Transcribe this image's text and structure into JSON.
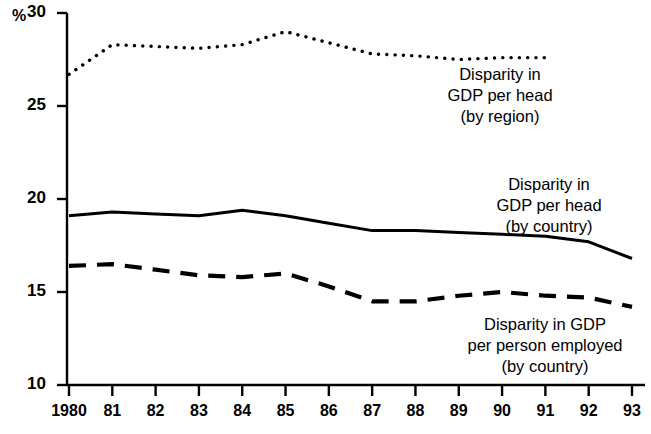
{
  "chart_data": {
    "type": "line",
    "title": "",
    "subtitle": "",
    "xlabel": "",
    "ylabel": "%",
    "y_unit_label": "%",
    "x": [
      1980,
      1981,
      1982,
      1983,
      1984,
      1985,
      1986,
      1987,
      1988,
      1989,
      1990,
      1991,
      1992,
      1993
    ],
    "xtick_labels": [
      "1980",
      "81",
      "82",
      "83",
      "84",
      "85",
      "86",
      "87",
      "88",
      "89",
      "90",
      "91",
      "92",
      "93"
    ],
    "ytick_labels": [
      "30",
      "25",
      "20",
      "15",
      "10"
    ],
    "yticks": [
      30,
      25,
      20,
      15,
      10
    ],
    "ylim": [
      10,
      30
    ],
    "xlim": [
      1980,
      1993
    ],
    "grid": false,
    "legend_position": "inline-annotations",
    "series": [
      {
        "name": "Disparity in GDP per head (by region)",
        "style": "dotted",
        "color": "#000000",
        "x": [
          1980,
          1981,
          1982,
          1983,
          1984,
          1985,
          1986,
          1987,
          1988,
          1989,
          1990,
          1991
        ],
        "values": [
          26.7,
          28.3,
          28.2,
          28.1,
          28.3,
          29.0,
          28.4,
          27.8,
          27.7,
          27.5,
          27.6,
          27.6
        ]
      },
      {
        "name": "Disparity in GDP per head (by country)",
        "style": "solid",
        "color": "#000000",
        "x": [
          1980,
          1981,
          1982,
          1983,
          1984,
          1985,
          1986,
          1987,
          1988,
          1989,
          1990,
          1991,
          1992,
          1993
        ],
        "values": [
          19.1,
          19.3,
          19.2,
          19.1,
          19.4,
          19.1,
          18.7,
          18.3,
          18.3,
          18.2,
          18.1,
          18.0,
          17.7,
          16.8
        ]
      },
      {
        "name": "Disparity in GDP per person employed (by country)",
        "style": "dashed",
        "color": "#000000",
        "x": [
          1980,
          1981,
          1982,
          1983,
          1984,
          1985,
          1986,
          1987,
          1988,
          1989,
          1990,
          1991,
          1992,
          1993
        ],
        "values": [
          16.4,
          16.5,
          16.2,
          15.9,
          15.8,
          16.0,
          15.3,
          14.5,
          14.5,
          14.8,
          15.0,
          14.8,
          14.7,
          14.2
        ]
      }
    ],
    "annotations": [
      {
        "id": "annotation-region",
        "lines": [
          "Disparity in",
          "GDP per head",
          "(by region)"
        ],
        "x_px": 500,
        "y_px": 64
      },
      {
        "id": "annotation-country-head",
        "lines": [
          "Disparity in",
          "GDP per head",
          "(by country)"
        ],
        "x_px": 549,
        "y_px": 174
      },
      {
        "id": "annotation-person-employed",
        "lines": [
          "Disparity in GDP",
          "per person employed",
          "(by country)"
        ],
        "x_px": 545,
        "y_px": 314
      }
    ]
  }
}
